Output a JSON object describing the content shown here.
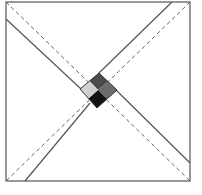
{
  "diagram": {
    "type": "square-with-crossed-diagonal-bands",
    "canvas": {
      "width": 202,
      "height": 195,
      "background": "#ffffff"
    },
    "frame": {
      "x": 6,
      "y": 2,
      "width": 184,
      "height": 179,
      "stroke": "#555555",
      "stroke_width": 1.2
    },
    "dashed_diagonals": [
      {
        "x1": 6,
        "y1": 2,
        "x2": 190,
        "y2": 181
      },
      {
        "x1": 190,
        "y1": 2,
        "x2": 6,
        "y2": 181
      }
    ],
    "dashed_style": {
      "stroke": "#666666",
      "dash": "4,3",
      "stroke_width": 1
    },
    "solid_lines": [
      {
        "x1": 6,
        "y1": 19,
        "x2": 81,
        "y2": 89
      },
      {
        "x1": 116,
        "y1": 90,
        "x2": 190,
        "y2": 163
      },
      {
        "x1": 172,
        "y1": 2,
        "x2": 99,
        "y2": 73
      },
      {
        "x1": 90,
        "y1": 103,
        "x2": 25,
        "y2": 181
      }
    ],
    "solid_style": {
      "stroke": "#555555",
      "stroke_width": 1.2
    },
    "center_diamond": {
      "vertices": {
        "top": [
          99,
          73
        ],
        "right": [
          117,
          90
        ],
        "bottom": [
          97,
          108
        ],
        "left": [
          80,
          89
        ]
      },
      "center": [
        98,
        90
      ],
      "quadrant_colors": {
        "top": "#4a4a4a",
        "right": "#6b6b6b",
        "bottom": "#111111",
        "left": "#d0d0d0"
      },
      "stroke": "#333333"
    }
  }
}
